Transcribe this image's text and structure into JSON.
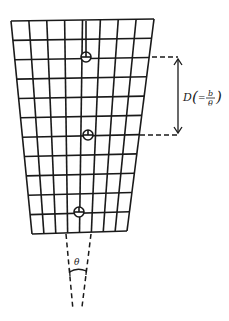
{
  "diagram": {
    "grid": {
      "columns": 8,
      "rows": 11,
      "top_left": [
        11,
        21
      ],
      "top_right": [
        154,
        19
      ],
      "bottom_left": [
        32,
        234
      ],
      "bottom_right": [
        127,
        231
      ]
    },
    "markers": [
      {
        "name": "marker-top",
        "x": 86,
        "y": 57
      },
      {
        "name": "marker-middle",
        "x": 88,
        "y": 135
      },
      {
        "name": "marker-bottom",
        "x": 79,
        "y": 212
      }
    ],
    "dimension": {
      "symbol": "D",
      "open_paren": "(",
      "equals": "=",
      "numerator": "b",
      "denominator": "θ",
      "close_paren": ")"
    },
    "angle_label": "θ"
  },
  "colors": {
    "line": "#1a1a1a",
    "background": "#ffffff"
  }
}
